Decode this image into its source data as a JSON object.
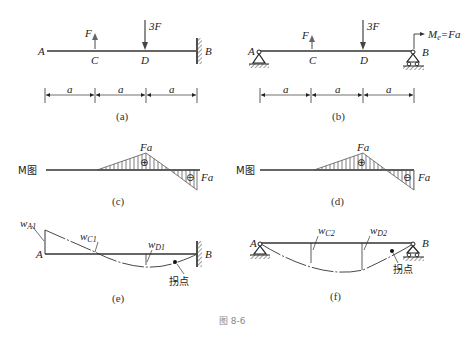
{
  "figure_caption": "图 8-6",
  "panels": {
    "a": {
      "caption": "(a)",
      "points": {
        "A": "A",
        "C": "C",
        "D": "D",
        "B": "B"
      },
      "forces": {
        "up": "F",
        "down": "3F"
      },
      "dims": [
        "a",
        "a",
        "a"
      ]
    },
    "b": {
      "caption": "(b)",
      "points": {
        "A": "A",
        "C": "C",
        "D": "D",
        "B": "B"
      },
      "forces": {
        "up": "F",
        "down": "3F"
      },
      "moment": {
        "M": "M",
        "sub": "e",
        "rest": "=Fa"
      },
      "dims": [
        "a",
        "a",
        "a"
      ]
    },
    "c": {
      "caption": "(c)",
      "label": "M图",
      "peak_pos": "Fa",
      "peak_neg": "Fa",
      "sign_pos": "⊕",
      "sign_neg": "⊖"
    },
    "d": {
      "caption": "(d)",
      "label": "M图",
      "peak_pos": "Fa",
      "peak_neg": "Fa",
      "sign_pos": "⊕",
      "sign_neg": "⊖"
    },
    "e": {
      "caption": "(e)",
      "points": {
        "A": "A",
        "B": "B"
      },
      "wA": {
        "w": "w",
        "sub": "A1"
      },
      "wC": {
        "w": "w",
        "sub": "C1"
      },
      "wD": {
        "w": "w",
        "sub": "D1"
      },
      "inflection": "拐点"
    },
    "f": {
      "caption": "(f)",
      "points": {
        "A": "A",
        "B": "B"
      },
      "wC": {
        "w": "w",
        "sub": "C2"
      },
      "wD": {
        "w": "w",
        "sub": "D2"
      },
      "inflection": "拐点"
    }
  }
}
